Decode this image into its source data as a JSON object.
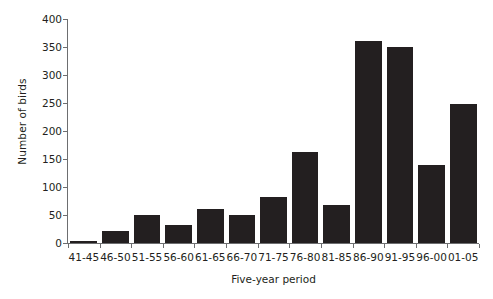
{
  "chart_data": {
    "type": "bar",
    "title": "",
    "xlabel": "Five-year period",
    "ylabel": "Number of birds",
    "categories": [
      "41-45",
      "46-50",
      "51-55",
      "56-60",
      "61-65",
      "66-70",
      "71-75",
      "76-80",
      "81-85",
      "86-90",
      "91-95",
      "96-00",
      "01-05"
    ],
    "values": [
      4,
      22,
      50,
      32,
      61,
      50,
      83,
      163,
      68,
      360,
      350,
      140,
      248
    ],
    "ylim": [
      0,
      400
    ],
    "y_ticks": [
      0,
      50,
      100,
      150,
      200,
      250,
      300,
      350,
      400
    ],
    "y_tick_labels": [
      "0",
      "50",
      "100",
      "150",
      "200",
      "250",
      "300",
      "350",
      "400"
    ],
    "grid": false,
    "legend": null,
    "bar_color": "#231f20",
    "axis_color": "#6d6e70",
    "background_color": "#ffffff"
  }
}
